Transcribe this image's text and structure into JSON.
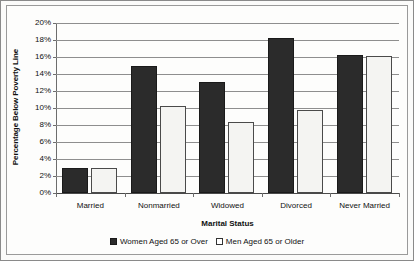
{
  "chart_data": {
    "type": "bar",
    "title": "",
    "xlabel": "Marital Status",
    "ylabel": "Percentage Below Poverty Line",
    "categories": [
      "Married",
      "Nonmarried",
      "Widowed",
      "Divorced",
      "Never Married"
    ],
    "series": [
      {
        "name": "Women Aged 65 or Over",
        "color": "#2b2b2b",
        "values": [
          3.0,
          15.0,
          13.1,
          18.2,
          16.2
        ]
      },
      {
        "name": "Men Aged 65 or Older",
        "color": "#f4f4f2",
        "values": [
          3.0,
          10.2,
          8.3,
          9.8,
          16.1
        ]
      }
    ],
    "ylim": [
      0,
      20
    ],
    "ytick_labels": [
      "20%",
      "18%",
      "16%",
      "14%",
      "12%",
      "10%",
      "8%",
      "6%",
      "4%",
      "2%",
      "0%"
    ],
    "ytick_values": [
      20,
      18,
      16,
      14,
      12,
      10,
      8,
      6,
      4,
      2,
      0
    ],
    "grid": true,
    "legend_position": "bottom"
  }
}
